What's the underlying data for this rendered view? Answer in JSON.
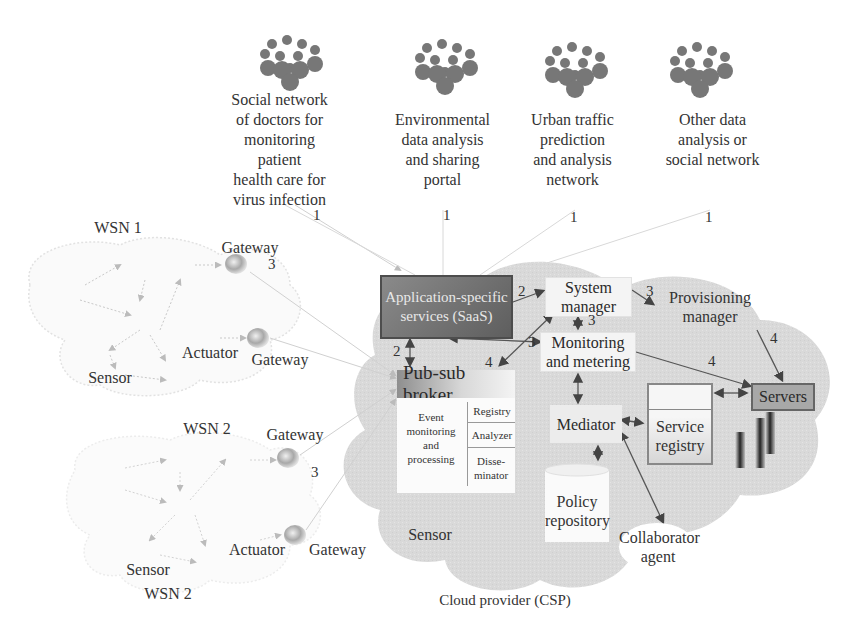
{
  "user_groups": [
    {
      "label": "Social network\nof doctors for\nmonitoring\npatient\nhealth care for\nvirus infection",
      "link_num": "1"
    },
    {
      "label": "Environmental\ndata analysis\nand sharing\nportal",
      "link_num": "1"
    },
    {
      "label": "Urban traffic\nprediction\nand analysis\nnetwork",
      "link_num": "1"
    },
    {
      "label": "Other data\nanalysis or\nsocial network",
      "link_num": "1"
    }
  ],
  "wsn1": {
    "title": "WSN 1",
    "gateway_top": "Gateway",
    "gateway_bottom": "Gateway",
    "actuator": "Actuator",
    "sensor": "Sensor",
    "link_num": "3"
  },
  "wsn2": {
    "title_top": "WSN 2",
    "title_bottom": "WSN 2",
    "gateway_top": "Gateway",
    "gateway_bottom": "Gateway",
    "actuator": "Actuator",
    "sensor": "Sensor",
    "link_num": "3"
  },
  "cloud": {
    "label": "Cloud provider (CSP)",
    "sensor_label": "Sensor",
    "saas": "Application-specific services (SaaS)",
    "system_manager": "System manager",
    "provisioning_manager": "Provisioning manager",
    "monitoring": "Monitoring and metering",
    "pubsub": {
      "title": "Pub-sub broker",
      "event": "Event monitoring and processing",
      "registry": "Registry",
      "analyzer": "Analyzer",
      "disseminator": "Disse-minator"
    },
    "mediator": "Mediator",
    "service_registry": "Service registry",
    "servers": "Servers",
    "policy_repository": "Policy repository",
    "collaborator_agent": "Collaborator agent"
  },
  "link_numbers": {
    "saas_to_sysmgr": "2",
    "saas_to_pubsub": "2",
    "sysmgr_to_provisioning": "3",
    "sysmgr_to_monitoring": "3",
    "monitoring_to_saas": "3",
    "sysmgr_to_pubsub": "4",
    "monitoring_to_servers": "4",
    "provisioning_to_servers": "4"
  }
}
